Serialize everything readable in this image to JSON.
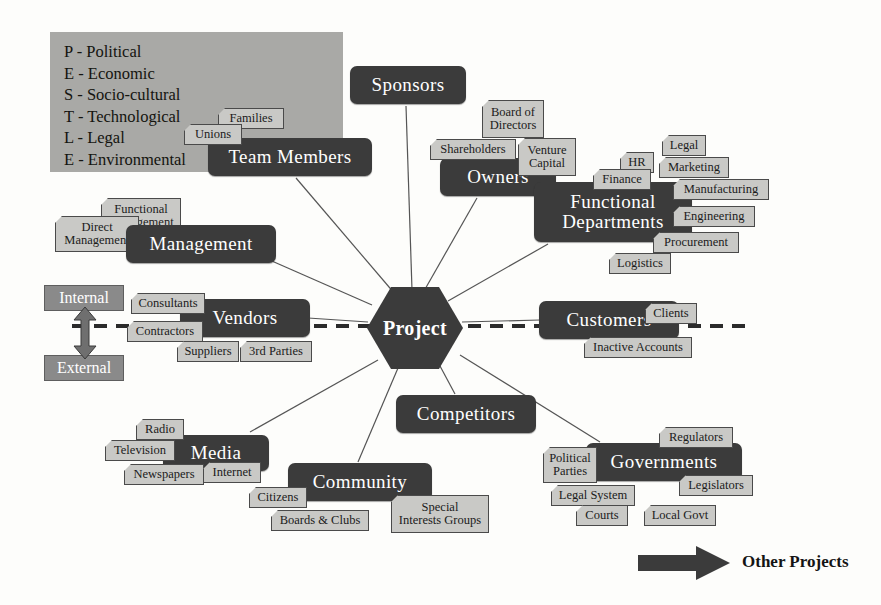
{
  "diagram": {
    "center": {
      "label": "Project"
    },
    "colors": {
      "primary_node": "#3b3b3b",
      "secondary_node": "#c9c9c6",
      "boundary_label": "#8a8a8a",
      "legend_panel": "#a9a9a6",
      "background": "#fdfdfb",
      "connector": "#555555"
    }
  },
  "pestle_legend": {
    "rows": [
      "P - Political",
      "E - Economic",
      "S - Socio-cultural",
      "T - Technological",
      "L - Legal",
      "E - Environmental"
    ]
  },
  "boundary": {
    "internal_label": "Internal",
    "external_label": "External",
    "divider_style": "dashed"
  },
  "footer_legend": {
    "arrow_label": "Other Projects"
  },
  "primary_nodes": [
    {
      "id": "sponsors",
      "label": "Sponsors",
      "x": 350,
      "y": 66,
      "w": 116,
      "h": 38,
      "font": 19
    },
    {
      "id": "team",
      "label": "Team Members",
      "x": 208,
      "y": 138,
      "w": 164,
      "h": 38,
      "font": 19
    },
    {
      "id": "owners",
      "label": "Owners",
      "x": 440,
      "y": 158,
      "w": 116,
      "h": 38,
      "font": 19
    },
    {
      "id": "funcdept",
      "label": "Functional\nDepartments",
      "x": 534,
      "y": 182,
      "w": 158,
      "h": 60,
      "font": 19
    },
    {
      "id": "managem",
      "label": "Management",
      "x": 126,
      "y": 225,
      "w": 150,
      "h": 38,
      "font": 19
    },
    {
      "id": "vendors",
      "label": "Vendors",
      "x": 180,
      "y": 299,
      "w": 130,
      "h": 38,
      "font": 19
    },
    {
      "id": "customers",
      "label": "Customers",
      "x": 539,
      "y": 301,
      "w": 140,
      "h": 38,
      "font": 19
    },
    {
      "id": "competit",
      "label": "Competitors",
      "x": 396,
      "y": 395,
      "w": 140,
      "h": 38,
      "font": 19
    },
    {
      "id": "media",
      "label": "Media",
      "x": 163,
      "y": 435,
      "w": 106,
      "h": 36,
      "font": 19
    },
    {
      "id": "community",
      "label": "Community",
      "x": 288,
      "y": 463,
      "w": 144,
      "h": 38,
      "font": 19
    },
    {
      "id": "governm",
      "label": "Governments",
      "x": 586,
      "y": 443,
      "w": 156,
      "h": 38,
      "font": 19
    }
  ],
  "secondary_nodes": [
    {
      "id": "families",
      "label": "Families",
      "parent": "team",
      "x": 218,
      "y": 108,
      "w": 66,
      "h": 21,
      "above": true
    },
    {
      "id": "unions",
      "label": "Unions",
      "parent": "team",
      "x": 184,
      "y": 124,
      "w": 58,
      "h": 21,
      "above": true
    },
    {
      "id": "boardofdir",
      "label": "Board of\nDirectors",
      "parent": "owners",
      "x": 482,
      "y": 100,
      "w": 62,
      "h": 38,
      "above": false
    },
    {
      "id": "sharehold",
      "label": "Shareholders",
      "parent": "owners",
      "x": 430,
      "y": 139,
      "w": 86,
      "h": 21,
      "above": true
    },
    {
      "id": "ventcap",
      "label": "Venture\nCapital",
      "parent": "owners",
      "x": 518,
      "y": 138,
      "w": 58,
      "h": 38,
      "above": true
    },
    {
      "id": "legal",
      "label": "Legal",
      "parent": "funcdept",
      "x": 662,
      "y": 135,
      "w": 44,
      "h": 21,
      "above": true
    },
    {
      "id": "hr",
      "label": "HR",
      "parent": "funcdept",
      "x": 620,
      "y": 152,
      "w": 34,
      "h": 21,
      "above": true
    },
    {
      "id": "marketing",
      "label": "Marketing",
      "parent": "funcdept",
      "x": 659,
      "y": 157,
      "w": 70,
      "h": 21,
      "above": true
    },
    {
      "id": "finance",
      "label": "Finance",
      "parent": "funcdept",
      "x": 593,
      "y": 169,
      "w": 58,
      "h": 21,
      "above": true
    },
    {
      "id": "manufact",
      "label": "Manufacturing",
      "parent": "funcdept",
      "x": 673,
      "y": 179,
      "w": 96,
      "h": 21,
      "above": true
    },
    {
      "id": "engineer",
      "label": "Engineering",
      "parent": "funcdept",
      "x": 673,
      "y": 206,
      "w": 82,
      "h": 21,
      "above": true
    },
    {
      "id": "procure",
      "label": "Procurement",
      "parent": "funcdept",
      "x": 653,
      "y": 232,
      "w": 86,
      "h": 21,
      "above": true
    },
    {
      "id": "logistics",
      "label": "Logistics",
      "parent": "funcdept",
      "x": 609,
      "y": 253,
      "w": 62,
      "h": 21,
      "above": true
    },
    {
      "id": "funcmgmt",
      "label": "Functional\nManagement",
      "parent": "managem",
      "x": 101,
      "y": 198,
      "w": 80,
      "h": 36,
      "above": false
    },
    {
      "id": "directmgmt",
      "label": "Direct\nManagement",
      "parent": "managem",
      "x": 55,
      "y": 216,
      "w": 84,
      "h": 36,
      "above": false
    },
    {
      "id": "consultants",
      "label": "Consultants",
      "parent": "vendors",
      "x": 131,
      "y": 293,
      "w": 74,
      "h": 21,
      "above": true
    },
    {
      "id": "contractors",
      "label": "Contractors",
      "parent": "vendors",
      "x": 127,
      "y": 321,
      "w": 76,
      "h": 21,
      "above": true
    },
    {
      "id": "suppliers",
      "label": "Suppliers",
      "parent": "vendors",
      "x": 177,
      "y": 341,
      "w": 62,
      "h": 21,
      "above": true
    },
    {
      "id": "thirdpart",
      "label": "3rd Parties",
      "parent": "vendors",
      "x": 240,
      "y": 341,
      "w": 72,
      "h": 21,
      "above": true
    },
    {
      "id": "clients",
      "label": "Clients",
      "parent": "customers",
      "x": 645,
      "y": 303,
      "w": 52,
      "h": 21,
      "above": true
    },
    {
      "id": "inactive",
      "label": "Inactive Accounts",
      "parent": "customers",
      "x": 584,
      "y": 337,
      "w": 108,
      "h": 21,
      "above": true
    },
    {
      "id": "radio",
      "label": "Radio",
      "parent": "media",
      "x": 136,
      "y": 419,
      "w": 48,
      "h": 21,
      "above": true
    },
    {
      "id": "television",
      "label": "Television",
      "parent": "media",
      "x": 105,
      "y": 440,
      "w": 70,
      "h": 21,
      "above": true
    },
    {
      "id": "newspapers",
      "label": "Newspapers",
      "parent": "media",
      "x": 124,
      "y": 464,
      "w": 80,
      "h": 21,
      "above": true
    },
    {
      "id": "internet",
      "label": "Internet",
      "parent": "media",
      "x": 203,
      "y": 462,
      "w": 58,
      "h": 21,
      "above": true
    },
    {
      "id": "citizens",
      "label": "Citizens",
      "parent": "community",
      "x": 249,
      "y": 487,
      "w": 58,
      "h": 21,
      "above": true
    },
    {
      "id": "boardsclubs",
      "label": "Boards & Clubs",
      "parent": "community",
      "x": 271,
      "y": 510,
      "w": 98,
      "h": 21,
      "above": true
    },
    {
      "id": "sig",
      "label": "Special\nInterests Groups",
      "parent": "community",
      "x": 391,
      "y": 495,
      "w": 98,
      "h": 38,
      "above": true
    },
    {
      "id": "regulators",
      "label": "Regulators",
      "parent": "governm",
      "x": 659,
      "y": 427,
      "w": 74,
      "h": 21,
      "above": true
    },
    {
      "id": "polparties",
      "label": "Political\nParties",
      "parent": "governm",
      "x": 543,
      "y": 447,
      "w": 54,
      "h": 36,
      "above": true
    },
    {
      "id": "legislators",
      "label": "Legislators",
      "parent": "governm",
      "x": 679,
      "y": 475,
      "w": 74,
      "h": 21,
      "above": true
    },
    {
      "id": "legalsystem",
      "label": "Legal System",
      "parent": "governm",
      "x": 551,
      "y": 485,
      "w": 84,
      "h": 21,
      "above": true
    },
    {
      "id": "courts",
      "label": "Courts",
      "parent": "governm",
      "x": 576,
      "y": 505,
      "w": 52,
      "h": 21,
      "above": true
    },
    {
      "id": "localgovt",
      "label": "Local Govt",
      "parent": "governm",
      "x": 644,
      "y": 505,
      "w": 72,
      "h": 21,
      "above": true
    }
  ],
  "connections": [
    {
      "from": "Project",
      "to": "Sponsors"
    },
    {
      "from": "Project",
      "to": "Team Members"
    },
    {
      "from": "Project",
      "to": "Owners"
    },
    {
      "from": "Project",
      "to": "Functional Departments"
    },
    {
      "from": "Project",
      "to": "Management"
    },
    {
      "from": "Project",
      "to": "Vendors"
    },
    {
      "from": "Project",
      "to": "Customers"
    },
    {
      "from": "Project",
      "to": "Competitors"
    },
    {
      "from": "Project",
      "to": "Media"
    },
    {
      "from": "Project",
      "to": "Community"
    },
    {
      "from": "Project",
      "to": "Governments"
    }
  ]
}
